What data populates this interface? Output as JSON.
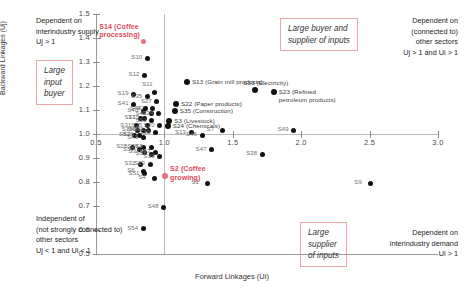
{
  "chart_data": {
    "type": "scatter",
    "title": "",
    "xlabel": "Forward Linkages (Ui)",
    "ylabel": "Backward Linkages (Uj)",
    "xlim": [
      0.5,
      3.0
    ],
    "ylim": [
      0.5,
      1.5
    ],
    "xticks": [
      "0.5",
      "1.0",
      "1.5",
      "2.0",
      "2.5",
      "3.0"
    ],
    "yticks": [
      "0.5",
      "0.6",
      "0.7",
      "0.8",
      "0.9",
      "1.0",
      "1.1",
      "1.2",
      "1.3",
      "1.4",
      "1.5"
    ],
    "grid": false,
    "reference_lines": {
      "x": 1.0,
      "y": 1.0
    },
    "legend": "none",
    "points": [
      {
        "id": "S14",
        "label": "S14 (Coffee processing)",
        "x": 0.845,
        "y": 1.385,
        "color": "#e8707f",
        "lpos": "above-left"
      },
      {
        "id": "S10",
        "label": "S10",
        "x": 0.875,
        "y": 1.315,
        "lpos": "left"
      },
      {
        "id": "S12",
        "label": "S12",
        "x": 0.855,
        "y": 1.245,
        "lpos": "left"
      },
      {
        "id": "S13",
        "label": "S13 (Grain mill products)",
        "x": 1.165,
        "y": 1.215,
        "lpos": "right",
        "named": true
      },
      {
        "id": "S33",
        "label": "S33 (Electricity)",
        "x": 1.665,
        "y": 1.185,
        "lpos": "above",
        "named": true
      },
      {
        "id": "S23",
        "label": "S23 (Refined petroleum products)",
        "x": 1.8,
        "y": 1.175,
        "lpos": "right",
        "named": true
      },
      {
        "id": "S19",
        "label": "S19",
        "x": 0.775,
        "y": 1.165,
        "lpos": "left"
      },
      {
        "id": "S11",
        "label": "S11",
        "x": 0.925,
        "y": 1.175,
        "lpos": "above"
      },
      {
        "id": "S35b",
        "label": "S35",
        "x": 0.875,
        "y": 1.155,
        "lpos": "left"
      },
      {
        "id": "S41",
        "label": "S41",
        "x": 0.775,
        "y": 1.125,
        "lpos": "left"
      },
      {
        "id": "S27",
        "label": "S27",
        "x": 0.945,
        "y": 1.135,
        "lpos": "left"
      },
      {
        "id": "S22",
        "label": "S22 (Paper products)",
        "x": 1.085,
        "y": 1.125,
        "lpos": "right",
        "named": true
      },
      {
        "id": "S21",
        "label": "S21",
        "x": 0.915,
        "y": 1.105,
        "lpos": "left"
      },
      {
        "id": "S44",
        "label": "S44",
        "x": 0.865,
        "y": 1.105,
        "lpos": "left"
      },
      {
        "id": "S40",
        "label": "S40",
        "x": 0.845,
        "y": 1.095,
        "lpos": "left"
      },
      {
        "id": "S35",
        "label": "S35 (Construction)",
        "x": 1.075,
        "y": 1.095,
        "lpos": "right",
        "named": true
      },
      {
        "id": "S42",
        "label": "S42",
        "x": 0.905,
        "y": 1.085,
        "lpos": "left"
      },
      {
        "id": "S34",
        "label": "S34",
        "x": 0.955,
        "y": 1.085,
        "lpos": "left"
      },
      {
        "id": "S17",
        "label": "S17",
        "x": 0.825,
        "y": 1.065,
        "lpos": "left"
      },
      {
        "id": "S15",
        "label": "S15",
        "x": 0.855,
        "y": 1.065,
        "lpos": "left"
      },
      {
        "id": "S53",
        "label": "S53",
        "x": 0.905,
        "y": 1.055,
        "lpos": "left"
      },
      {
        "id": "S3",
        "label": "S3 (Livestock)",
        "x": 1.035,
        "y": 1.055,
        "lpos": "right",
        "named": true
      },
      {
        "id": "S24",
        "label": "S24 (Chemicals)",
        "x": 1.025,
        "y": 1.035,
        "lpos": "right",
        "named": true
      },
      {
        "id": "S31",
        "label": "S31",
        "x": 0.795,
        "y": 1.035,
        "lpos": "left"
      },
      {
        "id": "S25",
        "label": "S25",
        "x": 0.875,
        "y": 1.035,
        "lpos": "left"
      },
      {
        "id": "S20",
        "label": "S20",
        "x": 0.965,
        "y": 1.035,
        "lpos": "left"
      },
      {
        "id": "S18",
        "label": "S18",
        "x": 0.805,
        "y": 1.015,
        "lpos": "left"
      },
      {
        "id": "S45",
        "label": "S45",
        "x": 0.845,
        "y": 1.015,
        "lpos": "left"
      },
      {
        "id": "S30",
        "label": "S30",
        "x": 0.885,
        "y": 1.015,
        "lpos": "left"
      },
      {
        "id": "S15b",
        "label": "S15",
        "x": 0.935,
        "y": 1.005,
        "lpos": "left"
      },
      {
        "id": "S52",
        "label": "S52",
        "x": 0.785,
        "y": 0.995,
        "lpos": "left"
      },
      {
        "id": "S26",
        "label": "S26",
        "x": 0.815,
        "y": 0.995,
        "lpos": "left"
      },
      {
        "id": "S43",
        "label": "S43",
        "x": 0.845,
        "y": 0.985,
        "lpos": "left"
      },
      {
        "id": "S13b",
        "label": "S13",
        "x": 1.195,
        "y": 1.005,
        "lpos": "left"
      },
      {
        "id": "S46",
        "label": "S46",
        "x": 1.275,
        "y": 0.995,
        "lpos": "left"
      },
      {
        "id": "S7",
        "label": "S7",
        "x": 1.425,
        "y": 1.015,
        "lpos": "left"
      },
      {
        "id": "S49",
        "label": "S49",
        "x": 1.945,
        "y": 1.015,
        "lpos": "left"
      },
      {
        "id": "S28",
        "label": "S28",
        "x": 0.765,
        "y": 0.945,
        "lpos": "left"
      },
      {
        "id": "S50",
        "label": "S50",
        "x": 0.815,
        "y": 0.935,
        "lpos": "left"
      },
      {
        "id": "S29b",
        "label": "S29",
        "x": 0.845,
        "y": 0.945,
        "lpos": "left"
      },
      {
        "id": "S37",
        "label": "S37",
        "x": 0.855,
        "y": 0.925,
        "lpos": "left"
      },
      {
        "id": "S8",
        "label": "S8",
        "x": 0.905,
        "y": 0.945,
        "lpos": "left"
      },
      {
        "id": "S51b",
        "label": "S51",
        "x": 0.905,
        "y": 0.915,
        "lpos": "left"
      },
      {
        "id": "S53b",
        "label": "S53",
        "x": 0.935,
        "y": 0.925,
        "lpos": "left"
      },
      {
        "id": "S39",
        "label": "S39",
        "x": 0.965,
        "y": 0.905,
        "lpos": "left"
      },
      {
        "id": "S32",
        "label": "S32",
        "x": 0.825,
        "y": 0.875,
        "lpos": "left"
      },
      {
        "id": "S29",
        "label": "S29",
        "x": 0.895,
        "y": 0.875,
        "lpos": "left"
      },
      {
        "id": "S6",
        "label": "S6",
        "x": 0.845,
        "y": 0.845,
        "lpos": "left"
      },
      {
        "id": "S51",
        "label": "S51",
        "x": 0.855,
        "y": 0.835,
        "lpos": "left"
      },
      {
        "id": "S4",
        "label": "S4",
        "x": 0.925,
        "y": 0.815,
        "lpos": "left"
      },
      {
        "id": "S2",
        "label": "S2 (Coffee growing)",
        "x": 1.005,
        "y": 0.825,
        "color": "#e8707f",
        "lpos": "right",
        "named": true
      },
      {
        "id": "S47",
        "label": "S47",
        "x": 1.345,
        "y": 0.935,
        "lpos": "left"
      },
      {
        "id": "S38",
        "label": "S38",
        "x": 1.715,
        "y": 0.915,
        "lpos": "left"
      },
      {
        "id": "S1",
        "label": "S1",
        "x": 1.315,
        "y": 0.795,
        "lpos": "left"
      },
      {
        "id": "S48",
        "label": "S48",
        "x": 0.995,
        "y": 0.695,
        "lpos": "left"
      },
      {
        "id": "S54",
        "label": "S54",
        "x": 0.845,
        "y": 0.605,
        "lpos": "left"
      },
      {
        "id": "S9",
        "label": "S9",
        "x": 2.505,
        "y": 0.795,
        "lpos": "left"
      }
    ],
    "annotations": {
      "top_left": "Dependent on\ninterindustry supply\nUj > 1",
      "top_left_box": "Large\ninput\nbuyer",
      "top_right": "Dependent on\n(connected to)\nother sectors\nUj > 1 and Ui > 1",
      "top_right_box": "Large buyer and\nsupplier of inputs",
      "bottom_left": "Independent of\n(not strongly connected to)\nother sectors\nUj < 1 and Ui < 1",
      "bottom_right": "Dependent on\ninterindustry demand\nUi > 1",
      "bottom_right_box": "Large\nsupplier\nof inputs"
    },
    "colors": {
      "point": "#111111",
      "highlight": "#e8707f",
      "highlight_text": "#e0475c",
      "box_border": "#e9a7a7",
      "axis": "#9a9a9a",
      "reference": "#b9b9b9"
    }
  }
}
